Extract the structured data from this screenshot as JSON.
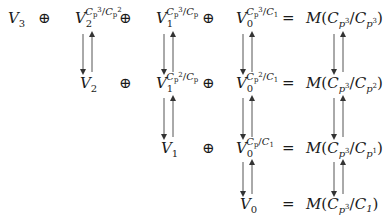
{
  "diagram": {
    "rows": [
      {
        "terms": [
          {
            "base": "V",
            "sub": "3"
          },
          {
            "op": "⊕"
          },
          {
            "base": "V",
            "sub": "2",
            "sup_num": "C",
            "sup_num_sub": "p",
            "sup_num_exp": "3",
            "sup_den": "C",
            "sup_den_sub": "p",
            "sup_den_exp": "2"
          },
          {
            "op": "⊕"
          },
          {
            "base": "V",
            "sub": "1",
            "sup_num": "C",
            "sup_num_sub": "p",
            "sup_num_exp": "3",
            "sup_den": "C",
            "sup_den_sub": "p",
            "sup_den_exp": ""
          },
          {
            "op": "⊕"
          },
          {
            "base": "V",
            "sub": "0",
            "sup_num": "C",
            "sup_num_sub": "p",
            "sup_num_exp": "3",
            "sup_den": "C",
            "sup_den_sub": "1",
            "sup_den_exp": ""
          },
          {
            "op": "="
          },
          {
            "rhs": "M",
            "num": "C",
            "num_sub": "p",
            "num_exp": "3",
            "den": "C",
            "den_sub": "p",
            "den_exp": "3"
          }
        ]
      },
      {
        "terms": [
          {
            "base": "V",
            "sub": "2"
          },
          {
            "op": "⊕"
          },
          {
            "base": "V",
            "sub": "1",
            "sup_num": "C",
            "sup_num_sub": "p",
            "sup_num_exp": "2",
            "sup_den": "C",
            "sup_den_sub": "p",
            "sup_den_exp": ""
          },
          {
            "op": "⊕"
          },
          {
            "base": "V",
            "sub": "0",
            "sup_num": "C",
            "sup_num_sub": "p",
            "sup_num_exp": "2",
            "sup_den": "C",
            "sup_den_sub": "1",
            "sup_den_exp": ""
          },
          {
            "op": "="
          },
          {
            "rhs": "M",
            "num": "C",
            "num_sub": "p",
            "num_exp": "3",
            "den": "C",
            "den_sub": "p",
            "den_exp": "2"
          }
        ]
      },
      {
        "terms": [
          {
            "base": "V",
            "sub": "1"
          },
          {
            "op": "⊕"
          },
          {
            "base": "V",
            "sub": "0",
            "sup_num": "C",
            "sup_num_sub": "p",
            "sup_num_exp": "",
            "sup_den": "C",
            "sup_den_sub": "1",
            "sup_den_exp": ""
          },
          {
            "op": "="
          },
          {
            "rhs": "M",
            "num": "C",
            "num_sub": "p",
            "num_exp": "3",
            "den": "C",
            "den_sub": "p",
            "den_exp": "1"
          }
        ]
      },
      {
        "terms": [
          {
            "base": "V",
            "sub": "0"
          },
          {
            "op": "="
          },
          {
            "rhs": "M",
            "num": "C",
            "num_sub": "p",
            "num_exp": "3",
            "den": "C",
            "den_sub": "1",
            "den_exp": ""
          }
        ]
      }
    ],
    "arrow_pairs": [
      {
        "column": "V2",
        "from_row": 0,
        "to_row": 1,
        "left": "down",
        "right": "up"
      },
      {
        "column": "V1",
        "from_row": 0,
        "to_row": 1,
        "left": "down",
        "right": "up"
      },
      {
        "column": "V1",
        "from_row": 1,
        "to_row": 2,
        "left": "down",
        "right": "up"
      },
      {
        "column": "V0",
        "from_row": 0,
        "to_row": 1,
        "left": "down",
        "right": "up"
      },
      {
        "column": "V0",
        "from_row": 1,
        "to_row": 2,
        "left": "down",
        "right": "up"
      },
      {
        "column": "V0",
        "from_row": 2,
        "to_row": 3,
        "left": "down",
        "right": "up"
      },
      {
        "column": "M",
        "from_row": 0,
        "to_row": 1,
        "left": "down",
        "right": "up"
      },
      {
        "column": "M",
        "from_row": 1,
        "to_row": 2,
        "left": "down",
        "right": "up"
      },
      {
        "column": "M",
        "from_row": 2,
        "to_row": 3,
        "left": "down",
        "right": "up"
      }
    ]
  },
  "labels": {
    "V": "V",
    "C": "C",
    "p": "p",
    "M": "M",
    "plus": "⊕",
    "eq": "=",
    "slash": "/",
    "lp": "(",
    "rp": ")",
    "s0": "0",
    "s1": "1",
    "s2": "2",
    "s3": "3"
  }
}
